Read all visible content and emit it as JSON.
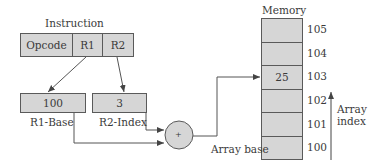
{
  "instruction": {
    "title": "Instruction",
    "fields": [
      {
        "label": "Opcode"
      },
      {
        "label": "R1"
      },
      {
        "label": "R2"
      }
    ]
  },
  "registers": {
    "base": {
      "value": "100",
      "label": "R1-Base"
    },
    "index": {
      "value": "3",
      "label": "R2-Index"
    }
  },
  "adder": {
    "symbol": "+"
  },
  "memory": {
    "title": "Memory",
    "cells": [
      {
        "address": "105",
        "value": ""
      },
      {
        "address": "104",
        "value": ""
      },
      {
        "address": "103",
        "value": "25"
      },
      {
        "address": "102",
        "value": ""
      },
      {
        "address": "101",
        "value": ""
      },
      {
        "address": "100",
        "value": ""
      }
    ],
    "base_label": "Array base"
  },
  "array_index": {
    "line1": "Array",
    "line2": "index"
  },
  "colors": {
    "box_fill": "#d6d6d6",
    "stroke": "#5a5a5a",
    "text": "#3a3a3a"
  }
}
